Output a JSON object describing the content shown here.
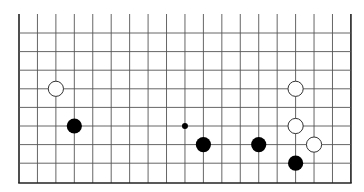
{
  "board": {
    "type": "go-board-partial",
    "columns": 19,
    "rows_visible": 9,
    "open_edge": "top",
    "grid": {
      "x0": 19,
      "dx": 18.44,
      "top": 14,
      "y0": 33,
      "dy": 18.6,
      "bottom": 183
    },
    "colors": {
      "background": "#ffffff",
      "line": "#555555",
      "border": "#222222",
      "black_stone": "#000000",
      "white_stone": "#ffffff",
      "white_stone_outline": "#333333"
    },
    "stone_radius": 7.6,
    "marker_radius": 3,
    "stones": [
      {
        "color": "white",
        "col": 2,
        "row": 3
      },
      {
        "color": "black",
        "col": 3,
        "row": 5
      },
      {
        "color": "black",
        "col": 10,
        "row": 6
      },
      {
        "color": "black",
        "col": 13,
        "row": 6
      },
      {
        "color": "white",
        "col": 15,
        "row": 3
      },
      {
        "color": "white",
        "col": 15,
        "row": 5
      },
      {
        "color": "white",
        "col": 16,
        "row": 6
      },
      {
        "color": "black",
        "col": 15,
        "row": 7
      }
    ],
    "markers": [
      {
        "type": "dot",
        "color": "black",
        "col": 9,
        "row": 5
      }
    ]
  }
}
